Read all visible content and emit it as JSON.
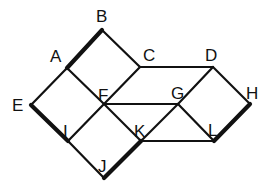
{
  "diagram": {
    "stroke_color": "#111111",
    "thin_width": 2.2,
    "thick_width": 4.2,
    "vertices": {
      "A": {
        "x": 67,
        "y": 68,
        "lx": 50,
        "ly": 62
      },
      "B": {
        "x": 102,
        "y": 30,
        "lx": 96,
        "ly": 22
      },
      "C": {
        "x": 140,
        "y": 67,
        "lx": 143,
        "ly": 61
      },
      "D": {
        "x": 213,
        "y": 67,
        "lx": 205,
        "ly": 61
      },
      "E": {
        "x": 31,
        "y": 105,
        "lx": 12,
        "ly": 111
      },
      "F": {
        "x": 104,
        "y": 104,
        "lx": 98,
        "ly": 101
      },
      "G": {
        "x": 178,
        "y": 104,
        "lx": 171,
        "ly": 99
      },
      "H": {
        "x": 250,
        "y": 104,
        "lx": 246,
        "ly": 99
      },
      "I": {
        "x": 68,
        "y": 141,
        "lx": 63,
        "ly": 137
      },
      "J": {
        "x": 104,
        "y": 178,
        "lx": 98,
        "ly": 172
      },
      "K": {
        "x": 141,
        "y": 141,
        "lx": 134,
        "ly": 137
      },
      "L": {
        "x": 214,
        "y": 141,
        "lx": 208,
        "ly": 136
      }
    },
    "edges": [
      {
        "from": "A",
        "to": "B",
        "thick": true
      },
      {
        "from": "B",
        "to": "C",
        "thick": false
      },
      {
        "from": "A",
        "to": "F",
        "thick": false
      },
      {
        "from": "C",
        "to": "F",
        "thick": false
      },
      {
        "from": "A",
        "to": "E",
        "thick": false
      },
      {
        "from": "E",
        "to": "I",
        "thick": true
      },
      {
        "from": "I",
        "to": "F",
        "thick": false
      },
      {
        "from": "I",
        "to": "J",
        "thick": false
      },
      {
        "from": "J",
        "to": "K",
        "thick": true
      },
      {
        "from": "F",
        "to": "K",
        "thick": false
      },
      {
        "from": "C",
        "to": "D",
        "thick": false
      },
      {
        "from": "F",
        "to": "G",
        "thick": false
      },
      {
        "from": "K",
        "to": "L",
        "thick": false
      },
      {
        "from": "K",
        "to": "G",
        "thick": false
      },
      {
        "from": "G",
        "to": "D",
        "thick": false
      },
      {
        "from": "G",
        "to": "L",
        "thick": false
      },
      {
        "from": "D",
        "to": "H",
        "thick": false
      },
      {
        "from": "L",
        "to": "H",
        "thick": true
      }
    ]
  }
}
